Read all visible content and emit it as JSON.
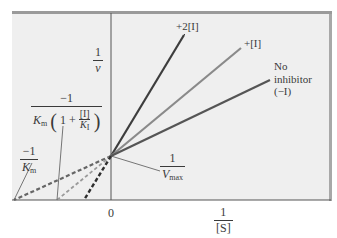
{
  "figure": {
    "type": "Lineweaver-Burk double-reciprocal plot (competitive inhibition)",
    "y_axis_label": {
      "numerator": "1",
      "denominator": "v"
    },
    "x_axis_label": {
      "numerator": "1",
      "denominator": "[S]"
    },
    "origin_label": "0",
    "y_intercept_label": {
      "numerator": "1",
      "denominator": "V",
      "denominator_sub": "max"
    },
    "x_intercept_inhibited_label": {
      "numerator": "−1",
      "den_Km": "K",
      "den_Km_sub": "m",
      "paren_open": "(",
      "one_plus": "1 +",
      "inner_num": "[I]",
      "inner_den": "K",
      "inner_den_sub": "I",
      "paren_close": ")"
    },
    "x_intercept_uninhibited_label": {
      "numerator": "−1",
      "denominator": "K",
      "denominator_sub": "m"
    },
    "lines": [
      {
        "name": "+2[I]",
        "label": "+2[I]",
        "color": "#3d3d3d",
        "x_intercept_px": 84,
        "end": [
          184,
          35
        ]
      },
      {
        "name": "+[I]",
        "label": "+[I]",
        "color": "#8a8a8a",
        "x_intercept_px": 57,
        "end": [
          241,
          48
        ]
      },
      {
        "name": "no-inhibitor",
        "label_lines": [
          "No",
          "inhibitor",
          "(−I)"
        ],
        "color": "#555555",
        "x_intercept_px": 14,
        "end": [
          270,
          80
        ]
      }
    ],
    "colors": {
      "background": "#efefef",
      "frame_top": "#9a9a9a",
      "axis": "#444444"
    }
  }
}
